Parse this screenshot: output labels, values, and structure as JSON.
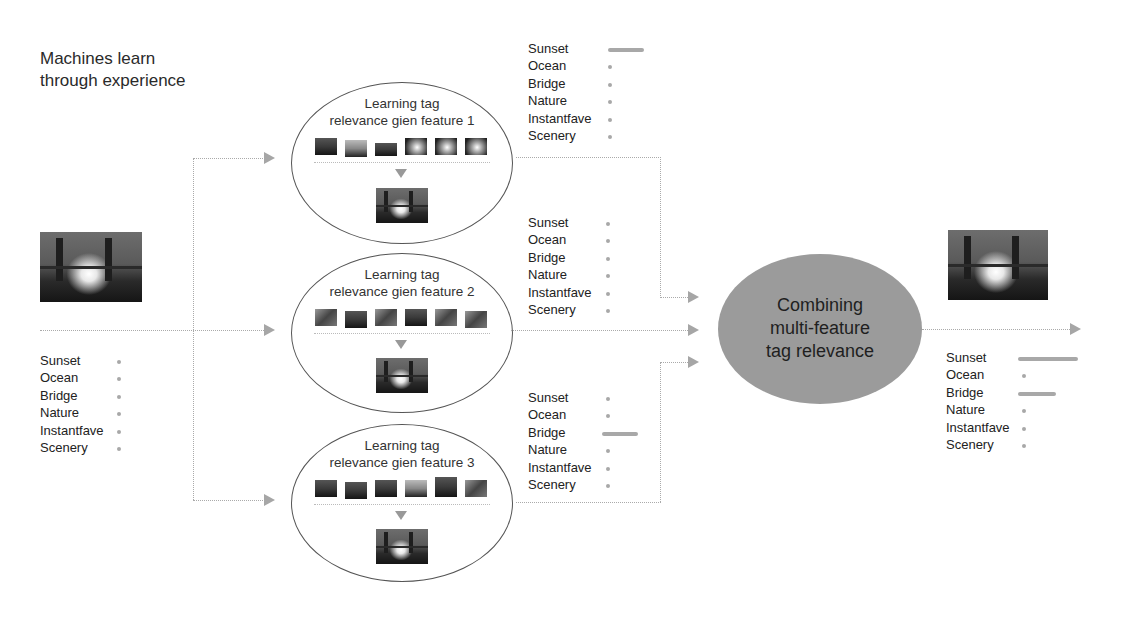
{
  "title": {
    "line1": "Machines learn",
    "line2": "through experience"
  },
  "input": {
    "image": "bridge-sunset-photo",
    "tags": [
      {
        "label": "Sunset",
        "bar": 4
      },
      {
        "label": "Ocean",
        "bar": 4
      },
      {
        "label": "Bridge",
        "bar": 4
      },
      {
        "label": "Nature",
        "bar": 4
      },
      {
        "label": "Instantfave",
        "bar": 4
      },
      {
        "label": "Scenery",
        "bar": 4
      }
    ]
  },
  "features": [
    {
      "title1": "Learning tag",
      "title2": "relevance gien feature 1",
      "tags": [
        {
          "label": "Sunset",
          "bar": 36
        },
        {
          "label": "Ocean",
          "bar": 4
        },
        {
          "label": "Bridge",
          "bar": 4
        },
        {
          "label": "Nature",
          "bar": 4
        },
        {
          "label": "Instantfave",
          "bar": 4
        },
        {
          "label": "Scenery",
          "bar": 4
        }
      ]
    },
    {
      "title1": "Learning tag",
      "title2": "relevance gien feature 2",
      "tags": [
        {
          "label": "Sunset",
          "bar": 4
        },
        {
          "label": "Ocean",
          "bar": 4
        },
        {
          "label": "Bridge",
          "bar": 4
        },
        {
          "label": "Nature",
          "bar": 4
        },
        {
          "label": "Instantfave",
          "bar": 4
        },
        {
          "label": "Scenery",
          "bar": 4
        }
      ]
    },
    {
      "title1": "Learning tag",
      "title2": "relevance gien feature 3",
      "tags": [
        {
          "label": "Sunset",
          "bar": 4
        },
        {
          "label": "Ocean",
          "bar": 4
        },
        {
          "label": "Bridge",
          "bar": 34
        },
        {
          "label": "Nature",
          "bar": 4
        },
        {
          "label": "Instantfave",
          "bar": 4
        },
        {
          "label": "Scenery",
          "bar": 4
        }
      ]
    }
  ],
  "combine": {
    "line1": "Combining",
    "line2": "multi-feature",
    "line3": "tag relevance"
  },
  "output": {
    "image": "bridge-sunset-photo",
    "tags": [
      {
        "label": "Sunset",
        "bar": 58
      },
      {
        "label": "Ocean",
        "bar": 4
      },
      {
        "label": "Bridge",
        "bar": 38
      },
      {
        "label": "Nature",
        "bar": 4
      },
      {
        "label": "Instantfave",
        "bar": 4
      },
      {
        "label": "Scenery",
        "bar": 4
      }
    ]
  },
  "colors": {
    "line": "#aaaaaa",
    "arrow": "#a6a6a6",
    "combine_fill": "#9b9b9b",
    "bar": "#a8a8a8"
  }
}
